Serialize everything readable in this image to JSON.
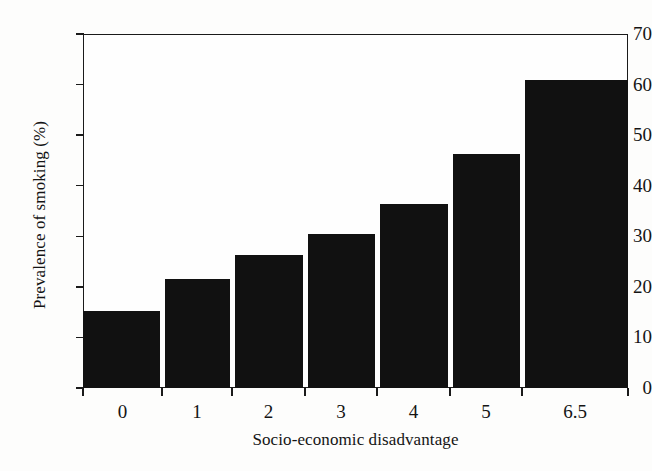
{
  "chart_data": {
    "type": "bar",
    "title": "",
    "xlabel": "Socio-economic disadvantage",
    "ylabel": "Prevalence of smoking (%)",
    "categories": [
      "0",
      "1",
      "2",
      "3",
      "4",
      "5",
      "6.5"
    ],
    "values": [
      15.3,
      21.5,
      26.4,
      30.4,
      36.4,
      46.2,
      61.0
    ],
    "ylim": [
      0,
      70
    ],
    "yticks": [
      0,
      10,
      20,
      30,
      40,
      50,
      60,
      70
    ],
    "ytick_labels": [
      "0",
      "10",
      "20",
      "30",
      "40",
      "50",
      "60",
      "70"
    ],
    "xtick_labels": [
      "0",
      "1",
      "2",
      "3",
      "4",
      "5",
      "6.5"
    ],
    "grid": false,
    "legend": false,
    "bar_color": "#111111",
    "axis_color": "#1a1a1a",
    "background_color": "#fdfdfc"
  }
}
